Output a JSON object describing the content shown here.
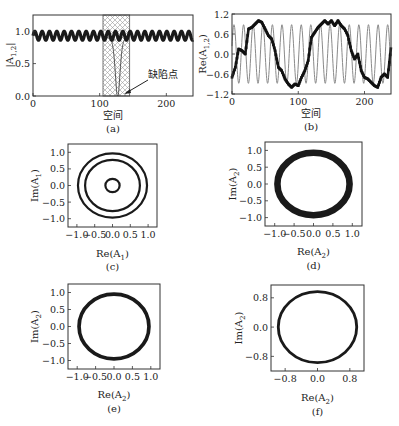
{
  "figure": {
    "panels": [
      "a",
      "b",
      "c",
      "d",
      "e",
      "f"
    ]
  },
  "chart_data": [
    {
      "id": "a",
      "type": "line",
      "caption": "(a)",
      "xlabel": "空间",
      "ylabel": "|A_{1,2}|",
      "ylabel_main": "|A",
      "ylabel_sub": "1,2",
      "xlim": [
        0,
        240
      ],
      "ylim": [
        0,
        1.25
      ],
      "xticks": [
        0,
        100,
        200
      ],
      "yticks": [
        0.0,
        0.5,
        1.0
      ],
      "xtick_labels": [
        "0",
        "100",
        "200"
      ],
      "ytick_labels": [
        "0.0",
        "0.5",
        "1.0"
      ],
      "grid": false,
      "annotation": {
        "text": "缺陷点",
        "arrow_to": [
          127,
          0.02
        ],
        "text_at": [
          150,
          0.25
        ]
      },
      "shaded_region": {
        "x0": 105,
        "x1": 145,
        "pattern": "crosshatch"
      },
      "series": [
        {
          "name": "|A_1| / |A_2| (thick, oscillating)",
          "style": "thick-dotted",
          "mean": 0.93,
          "amplitude": 0.07,
          "period": 11,
          "x_range": [
            0,
            240
          ]
        },
        {
          "name": "defect dip",
          "style": "thin",
          "min_at": 127,
          "min_value": 0.0,
          "baseline": 0.9
        }
      ]
    },
    {
      "id": "b",
      "type": "line",
      "caption": "(b)",
      "xlabel": "空间",
      "ylabel": "Re(A_{1,2})",
      "ylabel_main": "Re(A",
      "ylabel_sub": "1,2",
      "ylabel_close": ")",
      "xlim": [
        0,
        240
      ],
      "ylim": [
        -1.2,
        1.2
      ],
      "xticks": [
        0,
        100,
        200
      ],
      "yticks": [
        -1.2,
        -0.6,
        0.0,
        0.6,
        1.2
      ],
      "xtick_labels": [
        "0",
        "100",
        "200"
      ],
      "ytick_labels": [
        "−1.2",
        "−0.6",
        "0.0",
        "0.6",
        "1.2"
      ],
      "grid": false,
      "series": [
        {
          "name": "Re(A_1) fast oscillation (gray)",
          "style": "thin-gray",
          "amplitude": 0.88,
          "period": 14.5,
          "x_range": [
            0,
            240
          ]
        },
        {
          "name": "Re(A_2) slow wave (black markers)",
          "style": "thick-dotted",
          "x": [
            0,
            5,
            10,
            15,
            20,
            25,
            30,
            35,
            40,
            45,
            50,
            55,
            60,
            65,
            70,
            75,
            80,
            85,
            90,
            95,
            100,
            105,
            110,
            115,
            120,
            125,
            130,
            135,
            140,
            145,
            150,
            155,
            160,
            165,
            170,
            175,
            180,
            185,
            190,
            195,
            200,
            205,
            210,
            215,
            220,
            225,
            230,
            235,
            240
          ],
          "y": [
            -0.7,
            -0.4,
            0.15,
            0.1,
            0.0,
            0.75,
            0.8,
            0.9,
            1.0,
            0.95,
            0.75,
            0.55,
            0.45,
            0.1,
            -0.4,
            -0.5,
            -0.75,
            -0.9,
            -1.0,
            -0.9,
            -0.95,
            -0.7,
            -0.5,
            -0.2,
            0.5,
            0.65,
            0.8,
            0.9,
            1.0,
            0.9,
            1.0,
            0.85,
            1.0,
            0.85,
            0.75,
            0.55,
            0.1,
            -0.15,
            0.0,
            -0.5,
            -0.7,
            -0.75,
            -0.85,
            -0.95,
            -1.0,
            -0.7,
            -0.6,
            -0.7,
            0.2
          ]
        }
      ]
    },
    {
      "id": "c",
      "type": "scatter",
      "caption": "(c)",
      "xlabel": "Re(A_1)",
      "xlabel_main": "Re(A",
      "xlabel_sub": "1",
      "ylabel": "Im(A_1)",
      "ylabel_main": "Im(A",
      "ylabel_sub": "1",
      "xlim": [
        -1.25,
        1.25
      ],
      "ylim": [
        -1.25,
        1.25
      ],
      "xticks": [
        -1.0,
        -0.5,
        0.0,
        0.5,
        1.0
      ],
      "yticks": [
        -1.0,
        -0.5,
        0.0,
        0.5,
        1.0
      ],
      "xtick_labels": [
        "−1.0",
        "−0.5",
        "0.0",
        "0.5",
        "1.0"
      ],
      "ytick_labels": [
        "−1.0",
        "−0.5",
        "0.0",
        "0.5",
        "1.0"
      ],
      "grid": false,
      "series": [
        {
          "name": "outer ring",
          "radius": 0.97,
          "thickness": 0.05
        },
        {
          "name": "middle ring",
          "radius": 0.77,
          "thickness": 0.05
        },
        {
          "name": "inner ring",
          "radius": 0.2,
          "thickness": 0.05
        }
      ]
    },
    {
      "id": "d",
      "type": "scatter",
      "caption": "(d)",
      "xlabel": "Re(A_2)",
      "xlabel_main": "Re(A",
      "xlabel_sub": "2",
      "ylabel": "Im(A_2)",
      "ylabel_main": "Im(A",
      "ylabel_sub": "2",
      "xlim": [
        -1.25,
        1.25
      ],
      "ylim": [
        -1.25,
        1.25
      ],
      "xticks": [
        -1.0,
        -0.5,
        0.0,
        0.5,
        1.0
      ],
      "yticks": [
        -1.0,
        -0.5,
        0.0,
        0.5,
        1.0
      ],
      "xtick_labels": [
        "−1.0",
        "−0.5",
        "0.0",
        "0.5",
        "1.0"
      ],
      "ytick_labels": [
        "−1.0",
        "−0.5",
        "0.0",
        "0.5",
        "1.0"
      ],
      "grid": false,
      "series": [
        {
          "name": "thick ring",
          "radius": 0.93,
          "thickness": 0.17
        }
      ]
    },
    {
      "id": "e",
      "type": "scatter",
      "caption": "(e)",
      "xlabel": "Re(A_2)",
      "xlabel_main": "Re(A",
      "xlabel_sub": "2",
      "ylabel": "Im(A_2)",
      "ylabel_main": "Im(A",
      "ylabel_sub": "2",
      "xlim": [
        -1.25,
        1.25
      ],
      "ylim": [
        -1.25,
        1.25
      ],
      "xticks": [
        -1.0,
        -0.5,
        0.0,
        0.5,
        1.0
      ],
      "yticks": [
        -1.0,
        -0.5,
        0.0,
        0.5,
        1.0
      ],
      "xtick_labels": [
        "−1.0",
        "−0.5",
        "0.0",
        "0.5",
        "1.0"
      ],
      "ytick_labels": [
        "−1.0",
        "−0.5",
        "0.0",
        "0.5",
        "1.0"
      ],
      "grid": false,
      "series": [
        {
          "name": "ring",
          "radius": 0.95,
          "thickness": 0.1
        }
      ]
    },
    {
      "id": "f",
      "type": "scatter",
      "caption": "(f)",
      "xlabel": "Re(A_2)",
      "xlabel_main": "Re(A",
      "xlabel_sub": "2",
      "ylabel": "Im(A_2)",
      "ylabel_main": "Im(A",
      "ylabel_sub": "2",
      "xlim": [
        -1.15,
        1.15
      ],
      "ylim": [
        -1.2,
        1.15
      ],
      "xticks": [
        -0.8,
        0.0,
        0.8
      ],
      "yticks": [
        -0.8,
        0.0,
        0.8
      ],
      "xtick_labels": [
        "−0.8",
        "0.0",
        "0.8"
      ],
      "ytick_labels": [
        "−0.8",
        "0.0",
        "0.8"
      ],
      "grid": false,
      "series": [
        {
          "name": "ring",
          "radius": 0.97,
          "thickness": 0.07
        }
      ]
    }
  ]
}
